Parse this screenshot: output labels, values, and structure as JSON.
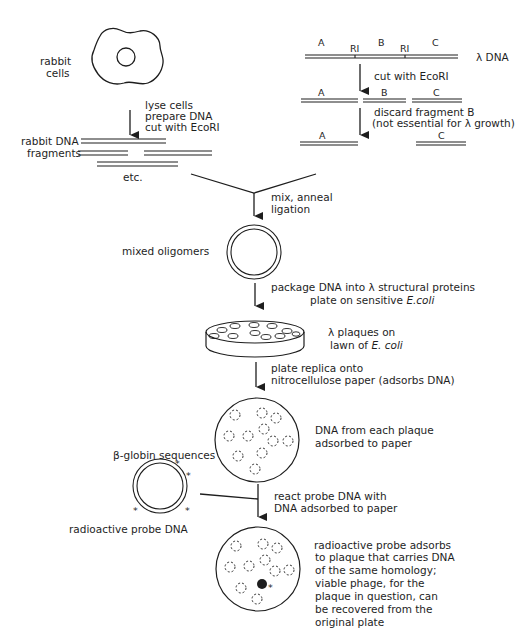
{
  "diagram": {
    "rabbit": {
      "label_line1": "rabbit",
      "label_line2": "cells",
      "step_line1": "lyse cells",
      "step_line2": "prepare DNA",
      "step_line3": "cut with EcoRI",
      "fragments_line1": "rabbit DNA",
      "fragments_line2": "fragments",
      "etc": "etc."
    },
    "lambda": {
      "seg_a": "A",
      "site1": "RI",
      "seg_b": "B",
      "site2": "RI",
      "seg_c": "C",
      "label": "λ DNA",
      "step1": "cut with EcoRI",
      "frag_a": "A",
      "frag_b": "B",
      "frag_c": "C",
      "step2_line1": "discard fragment B",
      "step2_line2": "(not essential for λ growth)",
      "final_a": "A",
      "final_c": "C"
    },
    "ligation": {
      "step_line1": "mix, anneal",
      "step_line2": "ligation",
      "product": "mixed oligomers"
    },
    "packaging": {
      "step_line1": "package DNA into λ structural proteins",
      "step_line2_prefix": "plate on sensitive ",
      "step_line2_organism": "E.coli",
      "plate_line1": "λ plaques on",
      "plate_line2_prefix": "lawn of ",
      "plate_line2_organism": "E. coli"
    },
    "replica": {
      "step_line1": "plate replica onto",
      "step_line2": "nitrocellulose paper (adsorbs DNA)",
      "result_line1": "DNA from each plaque",
      "result_line2": "adsorbed to paper"
    },
    "probe": {
      "sequences": "β-globin sequences",
      "label": "radioactive probe DNA",
      "marker": "*",
      "step_line1": "react probe DNA with",
      "step_line2": "DNA adsorbed to paper"
    },
    "result": {
      "line1": "radioactive probe adsorbs",
      "line2": "to plaque that carries DNA",
      "line3": "of the same homology;",
      "line4": "viable phage, for the",
      "line5": "plaque in question, can",
      "line6": "be recovered from the",
      "line7": "original plate",
      "marker": "*"
    }
  }
}
